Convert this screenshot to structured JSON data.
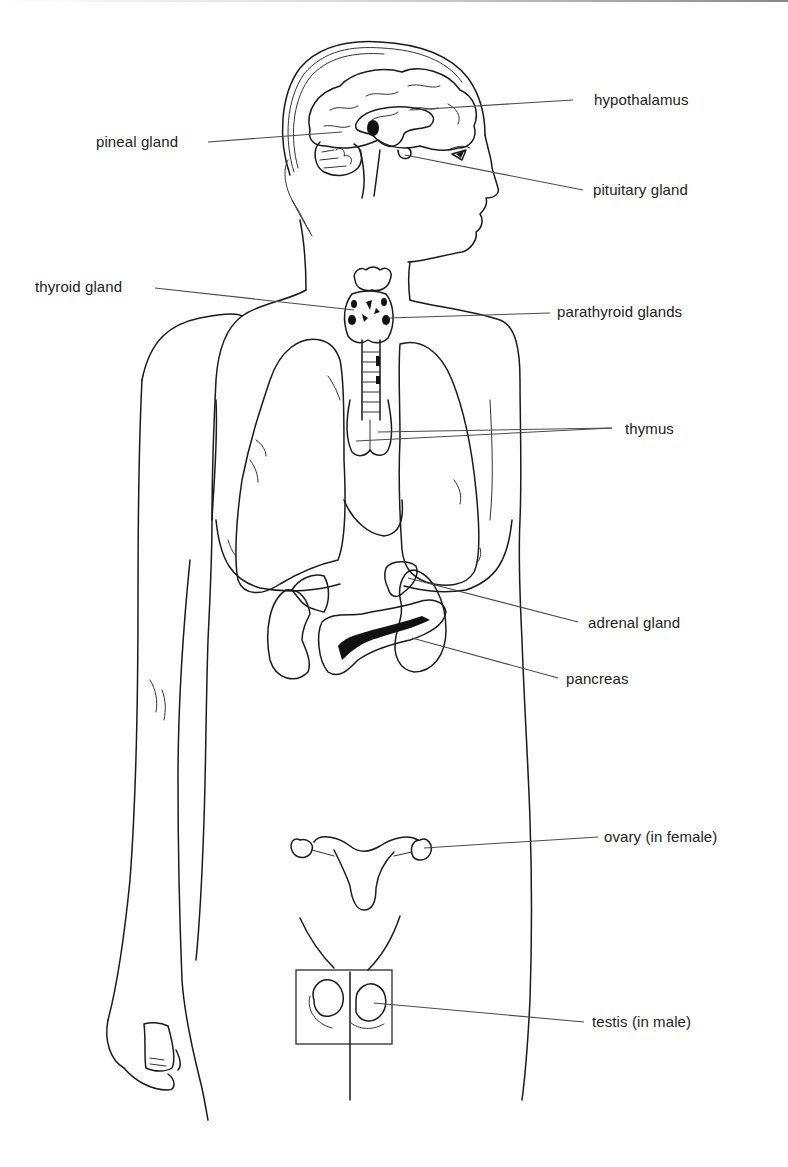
{
  "figure": {
    "colors": {
      "background": "#ffffff",
      "ink": "#1a1a1a",
      "label_text": "#222222",
      "leader_line": "#4a4a4a"
    },
    "labels": {
      "hypothalamus": "hypothalamus",
      "pineal_gland": "pineal gland",
      "pituitary_gland": "pituitary gland",
      "thyroid_gland": "thyroid gland",
      "parathyroid_glands": "parathyroid glands",
      "thymus": "thymus",
      "adrenal_gland": "adrenal gland",
      "pancreas": "pancreas",
      "ovary": "ovary (in female)",
      "testis": "testis (in male)"
    }
  }
}
